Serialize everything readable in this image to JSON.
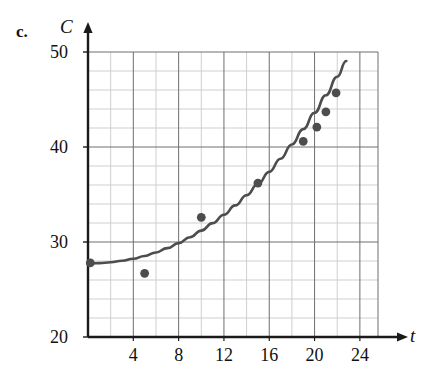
{
  "figure": {
    "part_label": "c.",
    "x_axis_label": "t",
    "y_axis_label": "C"
  },
  "chart_data": {
    "type": "scatter",
    "title": "",
    "xlabel": "t",
    "ylabel": "C",
    "xlim": [
      0,
      25.6
    ],
    "ylim": [
      20,
      50
    ],
    "grid": true,
    "legend": null,
    "x_major_ticks": [
      4,
      8,
      12,
      16,
      20,
      24
    ],
    "x_tick_labels": [
      "4",
      "8",
      "12",
      "16",
      "20",
      "24"
    ],
    "x_minor_step": 2,
    "y_major_ticks": [
      20,
      30,
      40,
      50
    ],
    "y_tick_labels": [
      "20",
      "30",
      "40",
      "50"
    ],
    "y_minor_step": 2,
    "points": [
      {
        "x": 0.2,
        "y": 27.8
      },
      {
        "x": 5.0,
        "y": 26.7
      },
      {
        "x": 10.0,
        "y": 32.6
      },
      {
        "x": 15.0,
        "y": 36.2
      },
      {
        "x": 19.0,
        "y": 40.6
      },
      {
        "x": 20.2,
        "y": 42.1
      },
      {
        "x": 21.0,
        "y": 43.7
      },
      {
        "x": 21.9,
        "y": 45.7
      }
    ],
    "curve": {
      "name": "fitted exponential model",
      "points": [
        {
          "x": 0.0,
          "y": 27.75
        },
        {
          "x": 1.0,
          "y": 27.78
        },
        {
          "x": 2.0,
          "y": 27.87
        },
        {
          "x": 3.0,
          "y": 28.02
        },
        {
          "x": 4.0,
          "y": 28.24
        },
        {
          "x": 5.0,
          "y": 28.53
        },
        {
          "x": 6.0,
          "y": 28.9
        },
        {
          "x": 7.0,
          "y": 29.35
        },
        {
          "x": 8.0,
          "y": 29.88
        },
        {
          "x": 9.0,
          "y": 30.5
        },
        {
          "x": 10.0,
          "y": 31.2
        },
        {
          "x": 11.0,
          "y": 31.99
        },
        {
          "x": 12.0,
          "y": 32.87
        },
        {
          "x": 13.0,
          "y": 33.85
        },
        {
          "x": 14.0,
          "y": 34.92
        },
        {
          "x": 15.0,
          "y": 36.1
        },
        {
          "x": 16.0,
          "y": 37.38
        },
        {
          "x": 17.0,
          "y": 38.77
        },
        {
          "x": 18.0,
          "y": 40.27
        },
        {
          "x": 19.0,
          "y": 41.88
        },
        {
          "x": 20.0,
          "y": 43.6
        },
        {
          "x": 21.0,
          "y": 45.45
        },
        {
          "x": 22.0,
          "y": 47.4
        },
        {
          "x": 22.8,
          "y": 49.05
        }
      ]
    },
    "colors": {
      "point": "#4d4d4d",
      "curve": "#4d4d4d",
      "axis": "#1a1a1a",
      "grid_major": "#6e6e6e",
      "grid_minor": "#cfcfcf",
      "background": "#ffffff"
    }
  }
}
